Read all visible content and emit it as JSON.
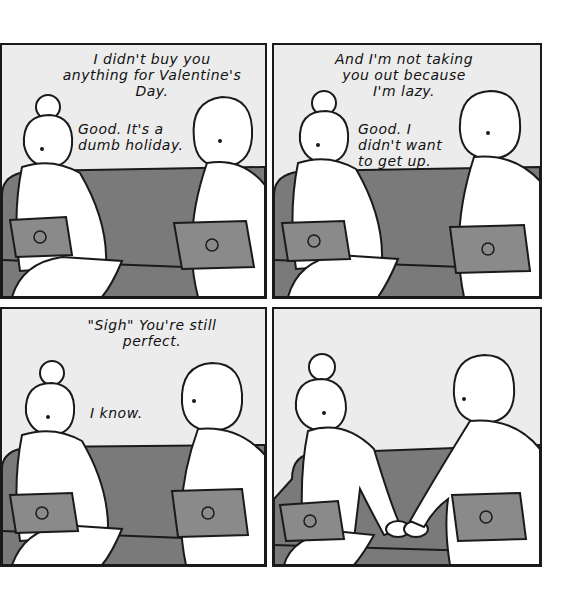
{
  "comic": {
    "panels": [
      {
        "id": 1,
        "speech_top": "I didn't buy you\nanything for Valentine's\nDay.",
        "speech_reply": "Good. It's a\ndumb holiday."
      },
      {
        "id": 2,
        "speech_top": "And I'm not taking\nyou out because\nI'm lazy.",
        "speech_reply": "Good. I\ndidn't want\nto get up."
      },
      {
        "id": 3,
        "speech_top": "\"Sigh\" You're still\nperfect.",
        "speech_reply": "I know."
      },
      {
        "id": 4,
        "speech_top": "",
        "speech_reply": ""
      }
    ],
    "colors": {
      "background": "#ececec",
      "couch": "#7a7a7a",
      "laptop": "#8a8a8a",
      "outline": "#1a1a1a",
      "figure": "#ffffff"
    }
  }
}
